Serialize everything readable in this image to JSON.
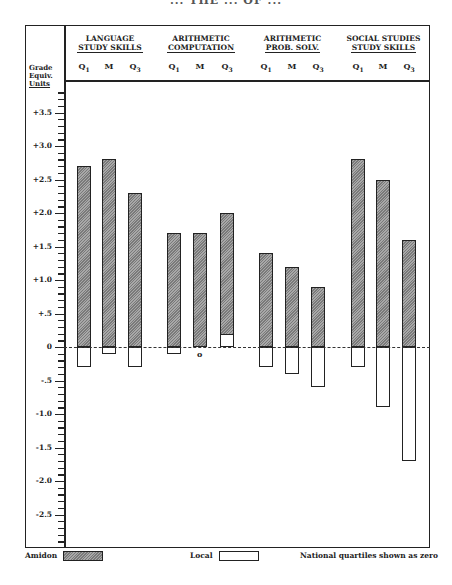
{
  "title": "... THE ... OF ...",
  "chart_data": {
    "type": "bar",
    "title": "",
    "ylabel": "Grade Equiv. Units",
    "xlabel": "",
    "ylim": [
      -2.9,
      3.9
    ],
    "y_ticks": [
      "+3.5",
      "+3.0",
      "+2.5",
      "+2.0",
      "+1.5",
      "+1.0",
      "+.5",
      "0",
      "-.5",
      "-1.0",
      "-1.5",
      "-2.0",
      "-2.5"
    ],
    "groups": [
      "LANGUAGE STUDY SKILLS",
      "ARITHMETIC COMPUTATION",
      "ARITHMETIC PROB. SOLV.",
      "SOCIAL STUDIES STUDY SKILLS"
    ],
    "sub_categories": [
      "Q1",
      "M",
      "Q3"
    ],
    "categories": [
      "Lang Q1",
      "Lang M",
      "Lang Q3",
      "ArComp Q1",
      "ArComp M",
      "ArComp Q3",
      "ArProb Q1",
      "ArProb M",
      "ArProb Q3",
      "SocSt Q1",
      "SocSt M",
      "SocSt Q3"
    ],
    "series": [
      {
        "name": "Amidon",
        "values": [
          2.7,
          2.8,
          2.3,
          1.7,
          1.7,
          2.0,
          1.4,
          1.2,
          0.9,
          2.8,
          2.5,
          1.6
        ]
      },
      {
        "name": "Local",
        "values": [
          -0.3,
          -0.1,
          -0.3,
          -0.1,
          0.0,
          0.2,
          -0.3,
          -0.4,
          -0.6,
          -0.3,
          -0.9,
          -1.7
        ]
      }
    ],
    "annotations": [
      "o (Local value zero at Arithmetic Computation M)"
    ],
    "legend": {
      "position": "bottom",
      "entries": [
        "Amidon",
        "Local"
      ],
      "note": "National quartiles shown as zero"
    },
    "grid": false
  },
  "header": {
    "axis_label": [
      "Grade",
      "Equiv.",
      "Units"
    ],
    "groups": [
      {
        "line1": "LANGUAGE",
        "line2": "STUDY SKILLS"
      },
      {
        "line1": "ARITHMETIC",
        "line2": "COMPUTATION"
      },
      {
        "line1": "ARITHMETIC",
        "line2": "PROB. SOLV."
      },
      {
        "line1": "SOCIAL STUDIES",
        "line2": "STUDY SKILLS"
      }
    ],
    "q": {
      "q1": "Q",
      "q1s": "1",
      "m": "M",
      "q3": "Q",
      "q3s": "3"
    }
  },
  "zero_mark": "o",
  "legend": {
    "amidon": "Amidon",
    "local": "Local",
    "note": "National quartiles shown as zero"
  },
  "colors": {
    "amidon_dark": "#7a7a7a",
    "amidon_light": "#a8a8a8",
    "line": "#222222"
  }
}
